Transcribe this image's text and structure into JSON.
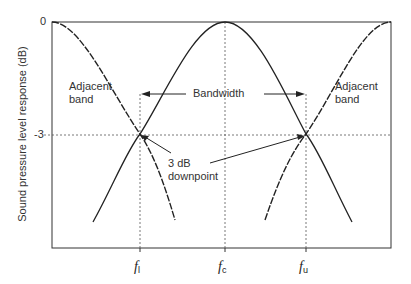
{
  "diagram": {
    "title": "",
    "y_axis_label": "Sound pressure level response (dB)",
    "y_ticks": [
      "0",
      "-3"
    ],
    "x_ticks": [
      {
        "main": "f",
        "sub": "l"
      },
      {
        "main": "f",
        "sub": "c"
      },
      {
        "main": "f",
        "sub": "u"
      }
    ],
    "labels": {
      "adjacent_left_line1": "Adjacent",
      "adjacent_left_line2": "band",
      "adjacent_right_line1": "Adjacent",
      "adjacent_right_line2": "band",
      "bandwidth": "Bandwidth",
      "downpoint_line1": "3 dB",
      "downpoint_line2": "downpoint"
    },
    "curves": [
      {
        "name": "center band",
        "style": "solid",
        "peak_at": "f_c"
      },
      {
        "name": "lower adjacent band",
        "style": "dashed",
        "peak_at": "left edge"
      },
      {
        "name": "upper adjacent band",
        "style": "dashed",
        "peak_at": "right edge"
      }
    ],
    "colors": {
      "line": "#222222",
      "guide": "#555555",
      "background": "#ffffff"
    }
  }
}
